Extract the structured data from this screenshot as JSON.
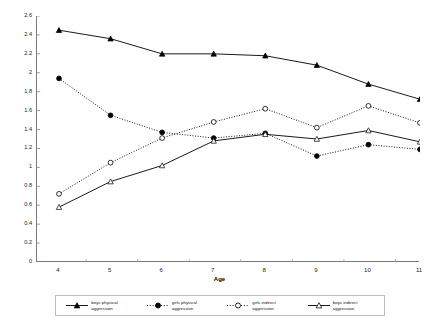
{
  "chart_data": {
    "type": "line",
    "title": "",
    "xlabel": "Age",
    "ylabel": "Frequency of aggressive behavior",
    "x": [
      4,
      5,
      6,
      7,
      8,
      9,
      10,
      11
    ],
    "xtick_labels": [
      "4",
      "5",
      "6",
      "7",
      "8",
      "9",
      "10",
      "11"
    ],
    "ytick_labels": [
      "0",
      "0.2",
      "0.4",
      "0.6",
      "0.8",
      "1",
      "1.2",
      "1.4",
      "1.6",
      "1.8",
      "2",
      "2.2",
      "2.4",
      "2.6"
    ],
    "ytick_values": [
      0,
      0.2,
      0.4,
      0.6,
      0.8,
      1.0,
      1.2,
      1.4,
      1.6,
      1.8,
      2.0,
      2.2,
      2.4,
      2.6
    ],
    "xlim": [
      4,
      11
    ],
    "ylim": [
      0,
      2.6
    ],
    "grid": false,
    "legend_position": "bottom",
    "series": [
      {
        "name": "boys physical aggression",
        "marker": "filled-triangle",
        "line_style": "solid",
        "color": "#000000",
        "values": [
          2.45,
          2.36,
          2.2,
          2.2,
          2.18,
          2.08,
          1.88,
          1.72
        ]
      },
      {
        "name": "girls physical aggression",
        "marker": "filled-circle",
        "line_style": "dotted",
        "color": "#000000",
        "values": [
          1.94,
          1.55,
          1.37,
          1.31,
          1.36,
          1.12,
          1.24,
          1.19
        ]
      },
      {
        "name": "girls indirect aggression",
        "marker": "open-circle",
        "line_style": "dotted",
        "color": "#000000",
        "values": [
          0.72,
          1.05,
          1.31,
          1.48,
          1.62,
          1.42,
          1.65,
          1.47
        ]
      },
      {
        "name": "boys indirect aggression",
        "marker": "open-triangle",
        "line_style": "solid",
        "color": "#000000",
        "values": [
          0.58,
          0.85,
          1.02,
          1.28,
          1.35,
          1.3,
          1.39,
          1.27
        ]
      }
    ]
  },
  "legend": {
    "items": [
      {
        "label": "boys physical aggression",
        "marker": "filled-triangle",
        "line_style": "solid"
      },
      {
        "label": "girls physical aggression",
        "marker": "filled-circle",
        "line_style": "dotted"
      },
      {
        "label": "girls indirect aggression",
        "marker": "open-circle",
        "line_style": "dotted"
      },
      {
        "label": "boys indirect aggression",
        "marker": "open-triangle",
        "line_style": "solid"
      }
    ]
  }
}
